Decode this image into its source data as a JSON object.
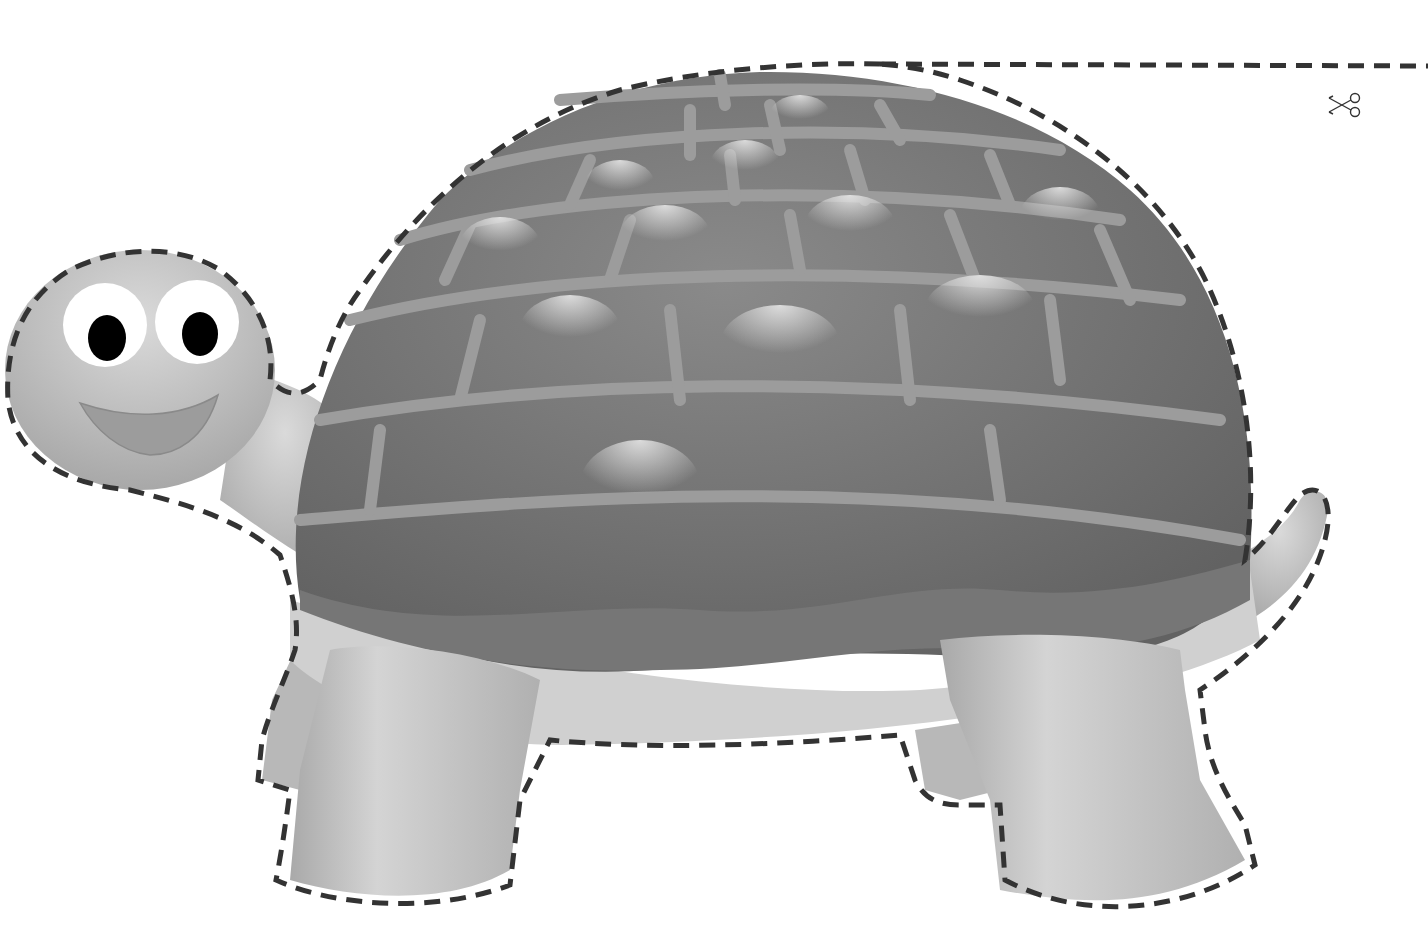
{
  "page": {
    "type": "printable-cutout",
    "background_color": "#ffffff"
  },
  "colors": {
    "shell_dark": "#6e6e6e",
    "shell_seam": "#9a9a9a",
    "shell_highlight": "#d8d8d8",
    "skin": "#b4b4b4",
    "skin_light": "#d2d2d2",
    "belly": "#cfcfcf",
    "cutline": "#333333",
    "eye_white": "#ffffff",
    "pupil": "#000000",
    "mouth": "#9a9a9a"
  },
  "icons": {
    "scissors": "scissors-icon"
  },
  "cut_guides": {
    "top_line": "dashed-cut-line",
    "outline": "dashed-turtle-outline"
  }
}
